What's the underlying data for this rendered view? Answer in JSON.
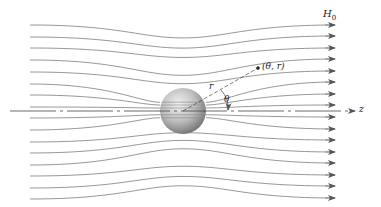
{
  "figure": {
    "field_label": "H",
    "field_subscript": "0",
    "axis_label": "z",
    "point_label": "(θ, r)",
    "radius_label": "r",
    "angle_label": "θ"
  },
  "colors": {
    "line": "#6a6a6a",
    "axis": "#444444",
    "sphere_light": "#e8e8e8",
    "sphere_dark": "#7a7a7a"
  },
  "geometry": {
    "sphere": {
      "cx": 183,
      "cy": 111,
      "r": 23
    },
    "axis": {
      "y": 111,
      "x_start": 10,
      "x_end": 355
    },
    "streamlines_left_y": [
      25,
      37,
      48,
      60,
      72,
      84,
      95,
      107,
      118,
      130,
      142,
      153,
      165,
      176,
      188,
      199
    ],
    "streamlines_right_y": [
      25,
      36,
      48,
      59,
      71,
      82,
      94,
      105,
      117,
      129,
      140,
      152,
      163,
      175,
      186,
      198
    ],
    "point": {
      "x": 258,
      "y": 68
    }
  }
}
